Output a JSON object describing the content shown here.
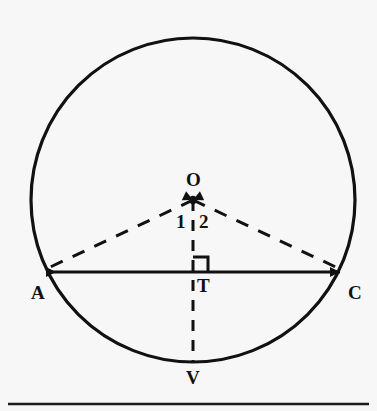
{
  "figure": {
    "type": "geometry-diagram",
    "background_color": "#f7f7f7",
    "stroke_color": "#111111",
    "circle": {
      "center_x": 193,
      "center_y": 200,
      "radius": 162,
      "stroke_width": 3.2
    },
    "points": [
      {
        "id": "O",
        "label": "O",
        "x": 193,
        "y": 200,
        "label_x": 186,
        "label_y": 170,
        "marker": "dot"
      },
      {
        "id": "A",
        "label": "A",
        "x": 40,
        "y": 272,
        "label_x": 31,
        "label_y": 283,
        "marker": "arrow"
      },
      {
        "id": "C",
        "label": "C",
        "x": 346,
        "y": 272,
        "label_x": 348,
        "label_y": 283,
        "marker": "arrow"
      },
      {
        "id": "T",
        "label": "T",
        "x": 193,
        "y": 272,
        "label_x": 197,
        "label_y": 276,
        "marker": "none"
      },
      {
        "id": "V",
        "label": "V",
        "x": 193,
        "y": 362,
        "label_x": 186,
        "label_y": 368,
        "marker": "none"
      }
    ],
    "angle_labels": [
      {
        "id": "angle-1",
        "label": "1",
        "x": 176,
        "y": 212
      },
      {
        "id": "angle-2",
        "label": "2",
        "x": 199,
        "y": 212
      }
    ],
    "segments": [
      {
        "id": "chord-AC",
        "from": "A",
        "to": "C",
        "style": "solid",
        "arrows": "both",
        "stroke_width": 3.2
      },
      {
        "id": "radius-OA",
        "from": "O",
        "to": "A",
        "style": "dashed",
        "arrows": "to-O",
        "stroke_width": 3.0
      },
      {
        "id": "radius-OC",
        "from": "O",
        "to": "C",
        "style": "dashed",
        "arrows": "to-O",
        "stroke_width": 3.0
      },
      {
        "id": "segment-OV",
        "from": "O",
        "to": "V",
        "style": "dashed",
        "arrows": "none",
        "stroke_width": 3.0
      }
    ],
    "right_angle_mark": {
      "id": "right-angle-at-T",
      "vertex_x": 193,
      "vertex_y": 272,
      "size": 15,
      "orientation": "upper-right"
    },
    "page_rule": {
      "id": "page-bottom-rule",
      "x1": 8,
      "x2": 369,
      "y": 404,
      "stroke_width": 2.4
    }
  }
}
